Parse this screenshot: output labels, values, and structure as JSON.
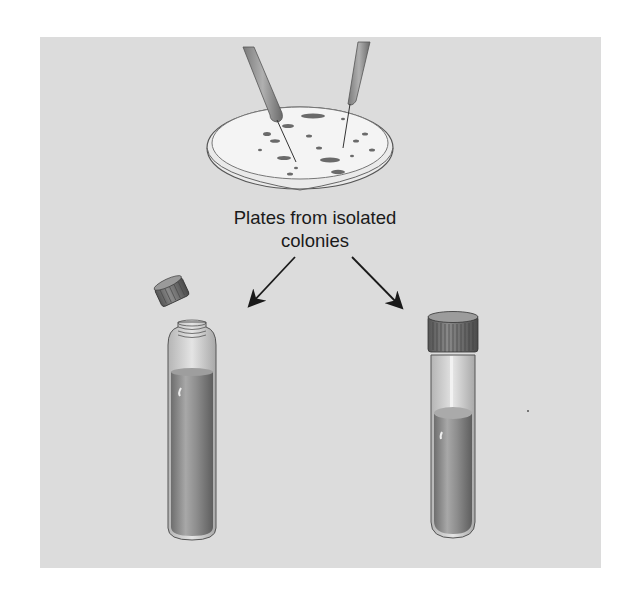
{
  "figure": {
    "caption": {
      "line1": "Plates from isolated",
      "line2": "colonies"
    },
    "elements": {
      "petri_dish": "petri-dish-with-colonies",
      "left_tube": "open-screw-cap-tube",
      "right_tube": "capped-culture-tube",
      "arrows": [
        "arrow-to-left-tube",
        "arrow-to-right-tube"
      ]
    },
    "colors": {
      "background": "#dcdcdc",
      "medium": "#8a8a8a",
      "glass": "#c8c8c8",
      "ink": "#1a1a1a"
    }
  }
}
